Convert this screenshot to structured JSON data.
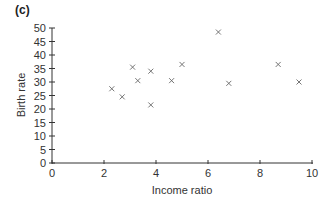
{
  "panel_label": "(c)",
  "chart_data": {
    "type": "scatter",
    "title": "",
    "xlabel": "Income ratio",
    "ylabel": "Birth rate",
    "xlim": [
      0,
      10
    ],
    "ylim": [
      0,
      50
    ],
    "x_ticks": [
      0,
      2,
      4,
      6,
      8,
      10
    ],
    "y_ticks": [
      0,
      5,
      10,
      15,
      20,
      25,
      30,
      35,
      40,
      45,
      50
    ],
    "grid": false,
    "legend": null,
    "marker": "x",
    "series": [
      {
        "name": "countries",
        "points": [
          {
            "x": 2.3,
            "y": 27.5
          },
          {
            "x": 2.7,
            "y": 24.5
          },
          {
            "x": 3.1,
            "y": 35.5
          },
          {
            "x": 3.3,
            "y": 30.5
          },
          {
            "x": 3.8,
            "y": 34
          },
          {
            "x": 3.8,
            "y": 21.5
          },
          {
            "x": 4.6,
            "y": 30.5
          },
          {
            "x": 5.0,
            "y": 36.5
          },
          {
            "x": 6.4,
            "y": 48.5
          },
          {
            "x": 6.8,
            "y": 29.5
          },
          {
            "x": 8.7,
            "y": 36.5
          },
          {
            "x": 9.5,
            "y": 30
          }
        ]
      }
    ]
  },
  "colors": {
    "axis": "#333333",
    "marker": "#666666",
    "text": "#333333"
  }
}
